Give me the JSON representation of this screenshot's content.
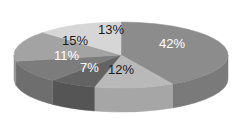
{
  "chart_data": {
    "type": "pie",
    "style": "3d",
    "title": "",
    "legend": "none",
    "slices": [
      {
        "label": "42%",
        "value": 42,
        "top_color": "#8c8c8c",
        "side_color": "#7a7a7a",
        "text_color": "#ffffff"
      },
      {
        "label": "12%",
        "value": 12,
        "top_color": "#b9b9b9",
        "side_color": "#a6a6a6",
        "text_color": "#1a1a1a"
      },
      {
        "label": "7%",
        "value": 7,
        "top_color": "#636363",
        "side_color": "#555555",
        "text_color": "#ffffff"
      },
      {
        "label": "11%",
        "value": 11,
        "top_color": "#7c7c7c",
        "side_color": "#6e6e6e",
        "text_color": "#ffffff"
      },
      {
        "label": "15%",
        "value": 15,
        "top_color": "#a3a3a3",
        "side_color": "#929292",
        "text_color": "#1a1a1a"
      },
      {
        "label": "13%",
        "value": 13,
        "top_color": "#d6d6d6",
        "side_color": "#c4c4c4",
        "text_color": "#1a1a1a"
      }
    ],
    "values": [
      42,
      12,
      7,
      11,
      15,
      13
    ],
    "categories": [
      "42%",
      "12%",
      "7%",
      "11%",
      "15%",
      "13%"
    ]
  }
}
